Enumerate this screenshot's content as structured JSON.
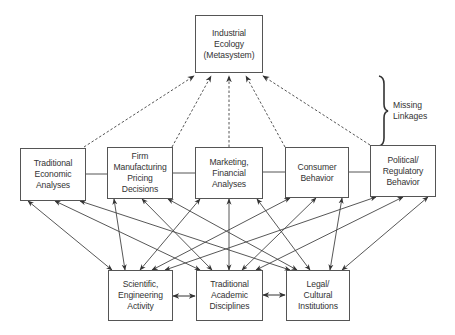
{
  "diagram": {
    "top": {
      "label": "Industrial Ecology\n(Metasystem)"
    },
    "middle": [
      {
        "label": "Traditional\nEconomic\nAnalyses"
      },
      {
        "label": "Firm\nManufacturing\nPricing\nDecisions"
      },
      {
        "label": "Marketing,\nFinancial\nAnalyses"
      },
      {
        "label": "Consumer\nBehavior"
      },
      {
        "label": "Political/\nRegulatory\nBehavior"
      }
    ],
    "bottom": [
      {
        "label": "Scientific,\nEngineering\nActivity"
      },
      {
        "label": "Traditional\nAcademic\nDisciplines"
      },
      {
        "label": "Legal/\nCultural\nInstitutions"
      }
    ],
    "annotation": {
      "label": "Missing\nLinkages"
    },
    "colors": {
      "line": "#444444",
      "box_border": "#555555",
      "text": "#333333"
    },
    "edges": {
      "dashed_to_top": [
        "Traditional Economic Analyses",
        "Firm Manufacturing Pricing Decisions",
        "Marketing, Financial Analyses",
        "Consumer Behavior",
        "Political/Regulatory Behavior"
      ],
      "middle_row_solid_links": "adjacent boxes connected by plain lines",
      "middle_to_bottom": "every middle box bidirectionally linked to every bottom box",
      "bottom_row_links": "bidirectional arrows between adjacent bottom boxes"
    }
  }
}
